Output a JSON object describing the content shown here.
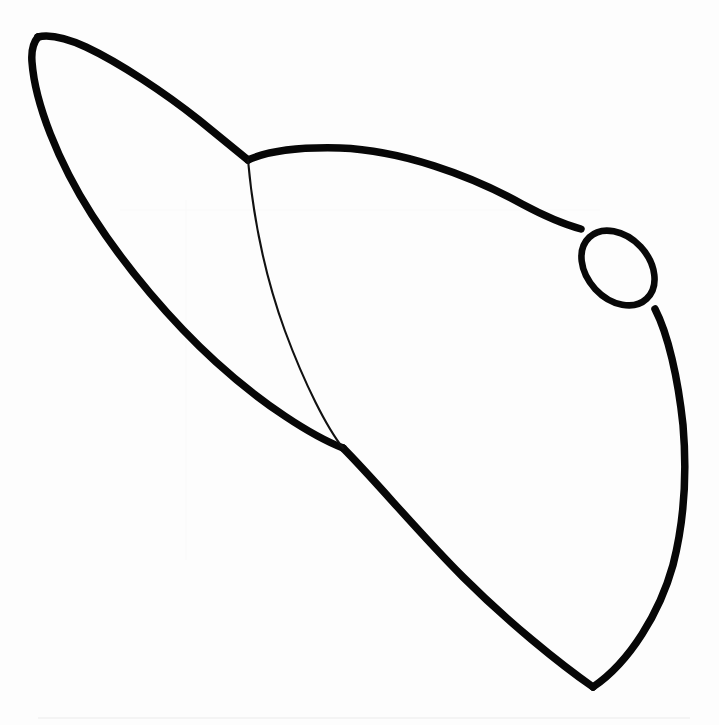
{
  "figure": {
    "title": "Liver outline line drawing",
    "kind": "line-art-anatomical-outline",
    "background_color": "#fdfdfd",
    "stroke_color": "#070707",
    "canvas": {
      "width": 719,
      "height": 725
    },
    "parts": [
      {
        "name": "left-lobe-outline",
        "label": "Left lobe superior and inferior border",
        "stroke_weight": "thick",
        "stroke_width_px": 7.5
      },
      {
        "name": "right-lobe-outline",
        "label": "Right lobe superior and inferior border",
        "stroke_weight": "thick",
        "stroke_width_px": 7.5
      },
      {
        "name": "falciform-fissure-line",
        "label": "Interlobar fissure",
        "stroke_weight": "thin",
        "stroke_width_px": 2.1
      },
      {
        "name": "gallbladder-ellipse",
        "label": "Gallbladder",
        "stroke_weight": "medium",
        "stroke_width_px": 6.6
      }
    ],
    "key_points": {
      "left_apex": [
        38,
        37
      ],
      "leftmost": [
        31,
        58
      ],
      "upper_junction": [
        248,
        160
      ],
      "top_arc_peak": [
        345,
        148
      ],
      "gallbladder_contact_upper": [
        581,
        229
      ],
      "gallbladder_contact_lower": [
        655,
        309
      ],
      "rightmost": [
        684,
        452
      ],
      "bottom_apex": [
        593,
        687
      ],
      "lower_junction": [
        343,
        448
      ]
    },
    "gallbladder_ellipse": {
      "center": [
        618,
        268
      ],
      "radius_x": 42,
      "radius_y": 31,
      "rotation_deg": 47
    }
  }
}
